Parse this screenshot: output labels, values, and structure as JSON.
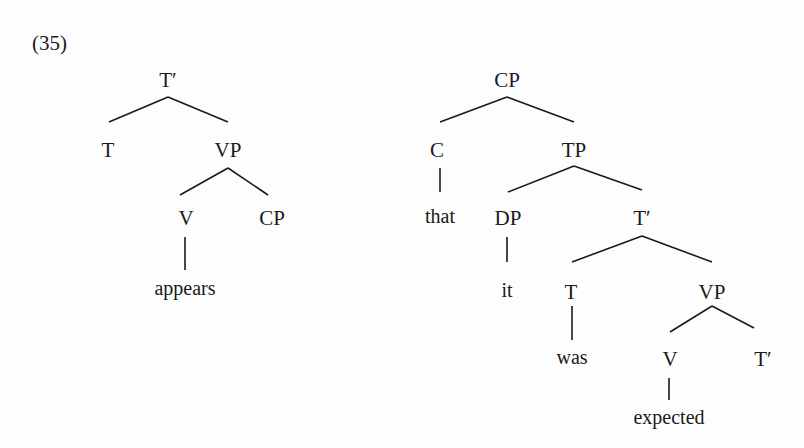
{
  "example_number": "(35)",
  "trees": [
    {
      "name": "left-tree",
      "nodes": [
        {
          "id": "t-bar",
          "label": "T′",
          "x": 168,
          "y": 80
        },
        {
          "id": "t",
          "label": "T",
          "x": 108,
          "y": 150
        },
        {
          "id": "vp",
          "label": "VP",
          "x": 228,
          "y": 150
        },
        {
          "id": "v",
          "label": "V",
          "x": 186,
          "y": 218
        },
        {
          "id": "cp",
          "label": "CP",
          "x": 272,
          "y": 218
        },
        {
          "id": "appears",
          "label": "appears",
          "x": 185,
          "y": 288,
          "word": true
        }
      ]
    },
    {
      "name": "right-tree",
      "nodes": [
        {
          "id": "cp",
          "label": "CP",
          "x": 507,
          "y": 80
        },
        {
          "id": "c",
          "label": "C",
          "x": 437,
          "y": 150
        },
        {
          "id": "tp",
          "label": "TP",
          "x": 574,
          "y": 150
        },
        {
          "id": "that",
          "label": "that",
          "x": 440,
          "y": 216,
          "word": true
        },
        {
          "id": "dp",
          "label": "DP",
          "x": 508,
          "y": 218
        },
        {
          "id": "t-bar",
          "label": "T′",
          "x": 642,
          "y": 218
        },
        {
          "id": "it",
          "label": "it",
          "x": 507,
          "y": 290,
          "word": true
        },
        {
          "id": "t",
          "label": "T",
          "x": 571,
          "y": 292
        },
        {
          "id": "vp",
          "label": "VP",
          "x": 712,
          "y": 292
        },
        {
          "id": "was",
          "label": "was",
          "x": 572,
          "y": 357,
          "word": true
        },
        {
          "id": "v",
          "label": "V",
          "x": 670,
          "y": 359
        },
        {
          "id": "t-bar-2",
          "label": "T′",
          "x": 763,
          "y": 359
        },
        {
          "id": "expected",
          "label": "expected",
          "x": 669,
          "y": 417,
          "word": true
        }
      ]
    }
  ],
  "edges": [
    [
      168,
      97,
      109,
      122
    ],
    [
      168,
      97,
      228,
      122
    ],
    [
      228,
      168,
      180,
      195
    ],
    [
      228,
      168,
      268,
      195
    ],
    [
      185,
      237,
      185,
      270
    ],
    [
      507,
      97,
      440,
      122
    ],
    [
      507,
      97,
      574,
      122
    ],
    [
      440,
      168,
      440,
      192
    ],
    [
      574,
      166,
      508,
      192
    ],
    [
      574,
      166,
      642,
      190
    ],
    [
      507,
      237,
      507,
      262
    ],
    [
      642,
      236,
      572,
      262
    ],
    [
      642,
      236,
      712,
      262
    ],
    [
      572,
      306,
      572,
      340
    ],
    [
      712,
      306,
      670,
      332
    ],
    [
      712,
      306,
      754,
      328
    ],
    [
      669,
      378,
      669,
      400
    ]
  ]
}
